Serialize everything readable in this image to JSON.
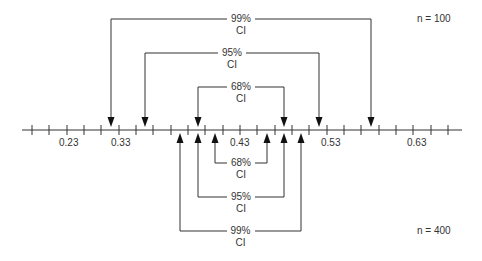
{
  "diagram": {
    "axis": {
      "tick_labels": [
        "0.23",
        "0.33",
        "0.43",
        "0.53",
        "0.63"
      ],
      "tick_label_x": [
        70,
        122,
        241,
        332,
        418
      ],
      "minor_tick_x": [
        32,
        49,
        67,
        84,
        101,
        119,
        136,
        153,
        171,
        188,
        205,
        223,
        240,
        257,
        275,
        292,
        309,
        327,
        344,
        361,
        379,
        396,
        413,
        431,
        448
      ]
    },
    "top_group": {
      "sample_size_label": "n = 100",
      "intervals": [
        {
          "level": "99%",
          "ci": "CI",
          "left_x": 111,
          "right_x": 371,
          "y": 19
        },
        {
          "level": "95%",
          "ci": "CI",
          "left_x": 145,
          "right_x": 319,
          "y": 53
        },
        {
          "level": "68%",
          "ci": "CI",
          "left_x": 198,
          "right_x": 284,
          "y": 87
        }
      ]
    },
    "bottom_group": {
      "sample_size_label": "n = 400",
      "intervals": [
        {
          "level": "68%",
          "ci": "CI",
          "left_x": 215,
          "right_x": 267,
          "y": 163
        },
        {
          "level": "95%",
          "ci": "CI",
          "left_x": 198,
          "right_x": 284,
          "y": 197
        },
        {
          "level": "99%",
          "ci": "CI",
          "left_x": 180,
          "right_x": 301,
          "y": 231
        }
      ]
    },
    "colors": {
      "line": "#333333",
      "text": "#333333",
      "background": "#ffffff"
    }
  }
}
